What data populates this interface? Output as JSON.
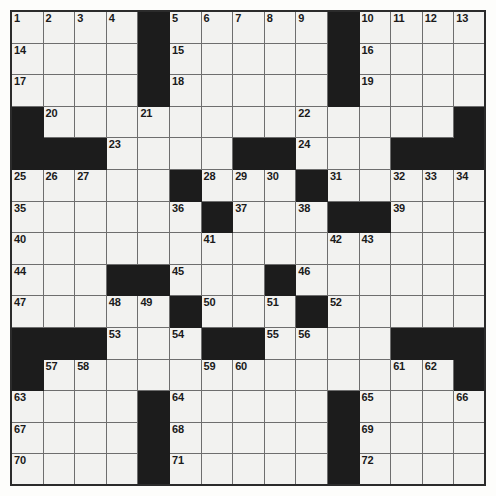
{
  "puzzle": {
    "type": "crossword-grid",
    "rows": 15,
    "cols": 15,
    "cell_size_px": 31.6,
    "colors": {
      "block": "#1c1c1c",
      "cell": "#f2f2f0",
      "gridline": "#6e6e6e",
      "frame": "#2b2b2b",
      "number": "#1a1a1a"
    },
    "grid": [
      [
        ".",
        ".",
        ".",
        ".",
        "#",
        ".",
        ".",
        ".",
        ".",
        ".",
        "#",
        ".",
        ".",
        ".",
        "."
      ],
      [
        ".",
        ".",
        ".",
        ".",
        "#",
        ".",
        ".",
        ".",
        ".",
        ".",
        "#",
        ".",
        ".",
        ".",
        "."
      ],
      [
        ".",
        ".",
        ".",
        ".",
        "#",
        ".",
        ".",
        ".",
        ".",
        ".",
        "#",
        ".",
        ".",
        ".",
        "."
      ],
      [
        "#",
        ".",
        ".",
        ".",
        ".",
        ".",
        ".",
        ".",
        ".",
        ".",
        ".",
        ".",
        ".",
        ".",
        "#"
      ],
      [
        "#",
        "#",
        "#",
        ".",
        ".",
        ".",
        ".",
        "#",
        "#",
        ".",
        ".",
        ".",
        "#",
        "#",
        "#"
      ],
      [
        ".",
        ".",
        ".",
        ".",
        ".",
        "#",
        ".",
        ".",
        ".",
        "#",
        ".",
        ".",
        ".",
        ".",
        "."
      ],
      [
        ".",
        ".",
        ".",
        ".",
        ".",
        ".",
        "#",
        ".",
        ".",
        ".",
        "#",
        "#",
        ".",
        ".",
        "."
      ],
      [
        ".",
        ".",
        ".",
        ".",
        ".",
        ".",
        ".",
        ".",
        ".",
        ".",
        ".",
        ".",
        ".",
        ".",
        "."
      ],
      [
        ".",
        ".",
        ".",
        "#",
        "#",
        ".",
        ".",
        ".",
        "#",
        ".",
        ".",
        ".",
        ".",
        ".",
        "."
      ],
      [
        ".",
        ".",
        ".",
        ".",
        ".",
        "#",
        ".",
        ".",
        ".",
        "#",
        ".",
        ".",
        ".",
        ".",
        "."
      ],
      [
        "#",
        "#",
        "#",
        ".",
        ".",
        ".",
        "#",
        "#",
        ".",
        ".",
        ".",
        ".",
        "#",
        "#",
        "#"
      ],
      [
        "#",
        ".",
        ".",
        ".",
        ".",
        ".",
        ".",
        ".",
        ".",
        ".",
        ".",
        ".",
        ".",
        ".",
        "#"
      ],
      [
        ".",
        ".",
        ".",
        ".",
        "#",
        ".",
        ".",
        ".",
        ".",
        ".",
        "#",
        ".",
        ".",
        ".",
        "."
      ],
      [
        ".",
        ".",
        ".",
        ".",
        "#",
        ".",
        ".",
        ".",
        ".",
        ".",
        "#",
        ".",
        ".",
        ".",
        "."
      ],
      [
        ".",
        ".",
        ".",
        ".",
        "#",
        ".",
        ".",
        ".",
        ".",
        ".",
        "#",
        ".",
        ".",
        ".",
        "."
      ]
    ],
    "numbers": [
      {
        "row": 0,
        "col": 0,
        "n": "1"
      },
      {
        "row": 0,
        "col": 1,
        "n": "2"
      },
      {
        "row": 0,
        "col": 2,
        "n": "3"
      },
      {
        "row": 0,
        "col": 3,
        "n": "4"
      },
      {
        "row": 0,
        "col": 5,
        "n": "5"
      },
      {
        "row": 0,
        "col": 6,
        "n": "6"
      },
      {
        "row": 0,
        "col": 7,
        "n": "7"
      },
      {
        "row": 0,
        "col": 8,
        "n": "8"
      },
      {
        "row": 0,
        "col": 9,
        "n": "9"
      },
      {
        "row": 0,
        "col": 11,
        "n": "10"
      },
      {
        "row": 0,
        "col": 12,
        "n": "11"
      },
      {
        "row": 0,
        "col": 13,
        "n": "12"
      },
      {
        "row": 0,
        "col": 14,
        "n": "13"
      },
      {
        "row": 1,
        "col": 0,
        "n": "14"
      },
      {
        "row": 1,
        "col": 5,
        "n": "15"
      },
      {
        "row": 1,
        "col": 11,
        "n": "16"
      },
      {
        "row": 2,
        "col": 0,
        "n": "17"
      },
      {
        "row": 2,
        "col": 5,
        "n": "18"
      },
      {
        "row": 2,
        "col": 11,
        "n": "19"
      },
      {
        "row": 3,
        "col": 1,
        "n": "20"
      },
      {
        "row": 3,
        "col": 4,
        "n": "21"
      },
      {
        "row": 3,
        "col": 9,
        "n": "22"
      },
      {
        "row": 4,
        "col": 3,
        "n": "23"
      },
      {
        "row": 4,
        "col": 9,
        "n": "24"
      },
      {
        "row": 5,
        "col": 0,
        "n": "25"
      },
      {
        "row": 5,
        "col": 1,
        "n": "26"
      },
      {
        "row": 5,
        "col": 2,
        "n": "27"
      },
      {
        "row": 5,
        "col": 6,
        "n": "28"
      },
      {
        "row": 5,
        "col": 7,
        "n": "29"
      },
      {
        "row": 5,
        "col": 8,
        "n": "30"
      },
      {
        "row": 5,
        "col": 10,
        "n": "31"
      },
      {
        "row": 5,
        "col": 12,
        "n": "32"
      },
      {
        "row": 5,
        "col": 13,
        "n": "33"
      },
      {
        "row": 5,
        "col": 14,
        "n": "34"
      },
      {
        "row": 6,
        "col": 0,
        "n": "35"
      },
      {
        "row": 6,
        "col": 5,
        "n": "36"
      },
      {
        "row": 6,
        "col": 7,
        "n": "37"
      },
      {
        "row": 6,
        "col": 9,
        "n": "38"
      },
      {
        "row": 6,
        "col": 12,
        "n": "39"
      },
      {
        "row": 7,
        "col": 0,
        "n": "40"
      },
      {
        "row": 7,
        "col": 6,
        "n": "41"
      },
      {
        "row": 7,
        "col": 10,
        "n": "42"
      },
      {
        "row": 7,
        "col": 11,
        "n": "43"
      },
      {
        "row": 8,
        "col": 0,
        "n": "44"
      },
      {
        "row": 8,
        "col": 5,
        "n": "45"
      },
      {
        "row": 8,
        "col": 9,
        "n": "46"
      },
      {
        "row": 9,
        "col": 0,
        "n": "47"
      },
      {
        "row": 9,
        "col": 3,
        "n": "48"
      },
      {
        "row": 9,
        "col": 4,
        "n": "49"
      },
      {
        "row": 9,
        "col": 6,
        "n": "50"
      },
      {
        "row": 9,
        "col": 8,
        "n": "51"
      },
      {
        "row": 9,
        "col": 10,
        "n": "52"
      },
      {
        "row": 10,
        "col": 3,
        "n": "53"
      },
      {
        "row": 10,
        "col": 5,
        "n": "54"
      },
      {
        "row": 10,
        "col": 8,
        "n": "55"
      },
      {
        "row": 10,
        "col": 9,
        "n": "56"
      },
      {
        "row": 11,
        "col": 1,
        "n": "57"
      },
      {
        "row": 11,
        "col": 2,
        "n": "58"
      },
      {
        "row": 11,
        "col": 6,
        "n": "59"
      },
      {
        "row": 11,
        "col": 7,
        "n": "60"
      },
      {
        "row": 11,
        "col": 12,
        "n": "61"
      },
      {
        "row": 11,
        "col": 13,
        "n": "62"
      },
      {
        "row": 12,
        "col": 0,
        "n": "63"
      },
      {
        "row": 12,
        "col": 5,
        "n": "64"
      },
      {
        "row": 12,
        "col": 11,
        "n": "65"
      },
      {
        "row": 12,
        "col": 14,
        "n": "66"
      },
      {
        "row": 13,
        "col": 0,
        "n": "67"
      },
      {
        "row": 13,
        "col": 5,
        "n": "68"
      },
      {
        "row": 13,
        "col": 11,
        "n": "69"
      },
      {
        "row": 14,
        "col": 0,
        "n": "70"
      },
      {
        "row": 14,
        "col": 5,
        "n": "71"
      },
      {
        "row": 14,
        "col": 11,
        "n": "72"
      }
    ],
    "letters": []
  }
}
